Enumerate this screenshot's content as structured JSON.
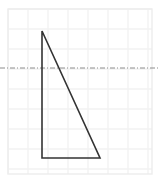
{
  "figure": {
    "canvas": {
      "width": 160,
      "height": 183,
      "background_color": "#ffffff"
    },
    "grid": {
      "label": "graph-paper-grid",
      "line_color": "#f2f2f2",
      "border_color": "#ededed",
      "cell_size": 20,
      "origin_x": 8,
      "origin_y": 9,
      "columns": 7,
      "rows": 8,
      "x_lines": [
        8,
        28,
        48,
        68,
        88,
        108,
        128,
        148
      ],
      "y_lines": [
        9,
        29,
        49,
        69,
        89,
        109,
        129,
        149,
        169
      ],
      "right_edge": 152,
      "bottom_edge": 174
    },
    "dashed_line": {
      "label": "horizontal-dash-dot-line",
      "color": "#8c8c8c",
      "y": 68,
      "x_start": 0,
      "x_end": 160,
      "stroke_width": 1,
      "dash_pattern": "5 2 1 2"
    },
    "shape": {
      "label": "right-triangle",
      "type": "triangle",
      "stroke_color": "#333333",
      "stroke_width": 1.6,
      "fill": "none",
      "points": "42,31 42,158 100,158",
      "vertices": [
        {
          "name": "apex",
          "x": 42,
          "y": 31
        },
        {
          "name": "bottom-left-right-angle",
          "x": 42,
          "y": 158
        },
        {
          "name": "bottom-right",
          "x": 100,
          "y": 158
        }
      ],
      "edges": [
        {
          "name": "vertical-leg",
          "from": "apex",
          "to": "bottom-left-right-angle",
          "length_px": 127
        },
        {
          "name": "horizontal-leg",
          "from": "bottom-left-right-angle",
          "to": "bottom-right",
          "length_px": 58
        },
        {
          "name": "hypotenuse",
          "from": "apex",
          "to": "bottom-right",
          "length_px": 140
        }
      ]
    }
  },
  "chart_data": {
    "type": "scatter",
    "title": "",
    "xlabel": "",
    "ylabel": "",
    "grid": true,
    "legend": null,
    "annotations": [
      "right triangle drawn on square grid paper",
      "horizontal dash-dot reference line crosses the triangle"
    ]
  }
}
